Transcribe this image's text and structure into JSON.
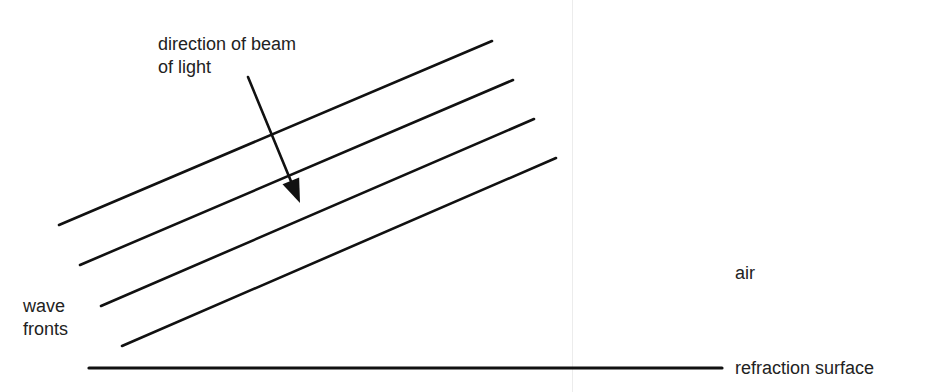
{
  "diagram": {
    "type": "physics-refraction-wavefronts",
    "labels": {
      "beam_direction_line1": "direction of beam",
      "beam_direction_line2": "of light",
      "wave_fronts_line1": "wave",
      "wave_fronts_line2": "fronts",
      "medium": "air",
      "surface": "refraction surface"
    },
    "wave_fronts": [
      {
        "x1": 59,
        "y1": 225,
        "x2": 492,
        "y2": 41
      },
      {
        "x1": 80,
        "y1": 265,
        "x2": 513,
        "y2": 80
      },
      {
        "x1": 101,
        "y1": 306,
        "x2": 534,
        "y2": 119
      },
      {
        "x1": 122,
        "y1": 346,
        "x2": 556,
        "y2": 158
      }
    ],
    "arrow": {
      "x1": 248,
      "y1": 77,
      "x2": 300,
      "y2": 203
    },
    "surface_line": {
      "x1": 89,
      "y1": 368,
      "x2": 722,
      "y2": 368
    },
    "colors": {
      "line": "#111111",
      "text": "#222222",
      "background": "#ffffff"
    }
  }
}
